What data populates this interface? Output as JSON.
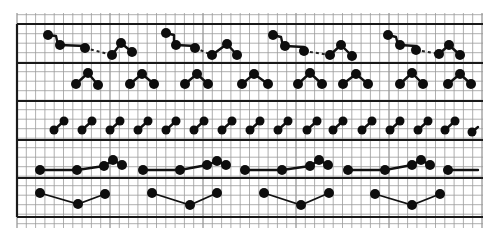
{
  "figure": {
    "width": 497,
    "height": 242,
    "colors": {
      "background": "#ffffff",
      "grid": "#9a9a9a",
      "ink": "#111111"
    }
  },
  "grid": {
    "x_start": 17,
    "x_end": 483,
    "y_start": 13,
    "y_end": 228,
    "spacing": 9.3,
    "left_border_x": 17
  },
  "bands": {
    "dividers_y": [
      24,
      63,
      101,
      140,
      178,
      217
    ],
    "rows": [
      {
        "id": "row-1",
        "pattern": "step-chain-with-dashed-link-and-peak",
        "node_radius": 5,
        "motifs": [
          {
            "nodes": [
              [
                48,
                35
              ],
              [
                60,
                45
              ],
              [
                85,
                48
              ],
              [
                112,
                55
              ],
              [
                121,
                43
              ],
              [
                132,
                52
              ]
            ],
            "corner": [
              56,
              36
            ]
          },
          {
            "nodes": [
              [
                166,
                33
              ],
              [
                176,
                45
              ],
              [
                195,
                48
              ],
              [
                212,
                55
              ],
              [
                227,
                44
              ],
              [
                237,
                55
              ]
            ],
            "corner": [
              174,
              35
            ]
          },
          {
            "nodes": [
              [
                273,
                35
              ],
              [
                285,
                46
              ],
              [
                304,
                51
              ],
              [
                330,
                55
              ],
              [
                341,
                45
              ],
              [
                352,
                56
              ]
            ],
            "corner": [
              281,
              37
            ]
          },
          {
            "nodes": [
              [
                388,
                35
              ],
              [
                400,
                45
              ],
              [
                416,
                50
              ],
              [
                439,
                54
              ],
              [
                449,
                45
              ],
              [
                460,
                55
              ]
            ],
            "corner": [
              396,
              37
            ]
          }
        ]
      },
      {
        "id": "row-2",
        "pattern": "caret-triplet",
        "node_radius": 5,
        "motifs": [
          {
            "nodes": [
              [
                76,
                84
              ],
              [
                88,
                73
              ],
              [
                98,
                85
              ]
            ]
          },
          {
            "nodes": [
              [
                130,
                84
              ],
              [
                142,
                74
              ],
              [
                154,
                84
              ]
            ]
          },
          {
            "nodes": [
              [
                185,
                84
              ],
              [
                197,
                74
              ],
              [
                208,
                84
              ]
            ]
          },
          {
            "nodes": [
              [
                242,
                84
              ],
              [
                254,
                74
              ],
              [
                268,
                84
              ]
            ]
          },
          {
            "nodes": [
              [
                298,
                84
              ],
              [
                310,
                73
              ],
              [
                322,
                84
              ]
            ]
          },
          {
            "nodes": [
              [
                343,
                84
              ],
              [
                356,
                74
              ],
              [
                368,
                84
              ]
            ]
          },
          {
            "nodes": [
              [
                400,
                84
              ],
              [
                412,
                73
              ],
              [
                423,
                84
              ]
            ]
          },
          {
            "nodes": [
              [
                448,
                84
              ],
              [
                460,
                74
              ],
              [
                471,
                84
              ]
            ]
          }
        ]
      },
      {
        "id": "row-3",
        "pattern": "dumbbell-pairs",
        "node_radius": 4.5,
        "motifs": [
          {
            "nodes": [
              [
                54,
                130
              ],
              [
                64,
                121
              ]
            ]
          },
          {
            "nodes": [
              [
                82,
                130
              ],
              [
                92,
                121
              ]
            ]
          },
          {
            "nodes": [
              [
                110,
                130
              ],
              [
                120,
                121
              ]
            ]
          },
          {
            "nodes": [
              [
                138,
                130
              ],
              [
                148,
                121
              ]
            ]
          },
          {
            "nodes": [
              [
                166,
                130
              ],
              [
                176,
                121
              ]
            ]
          },
          {
            "nodes": [
              [
                194,
                130
              ],
              [
                204,
                121
              ]
            ]
          },
          {
            "nodes": [
              [
                222,
                130
              ],
              [
                232,
                121
              ]
            ]
          },
          {
            "nodes": [
              [
                250,
                130
              ],
              [
                260,
                121
              ]
            ]
          },
          {
            "nodes": [
              [
                278,
                130
              ],
              [
                288,
                121
              ]
            ]
          },
          {
            "nodes": [
              [
                307,
                130
              ],
              [
                317,
                121
              ]
            ]
          },
          {
            "nodes": [
              [
                333,
                130
              ],
              [
                343,
                121
              ]
            ]
          },
          {
            "nodes": [
              [
                362,
                130
              ],
              [
                372,
                121
              ]
            ]
          },
          {
            "nodes": [
              [
                390,
                130
              ],
              [
                400,
                121
              ]
            ]
          },
          {
            "nodes": [
              [
                418,
                130
              ],
              [
                428,
                121
              ]
            ]
          },
          {
            "nodes": [
              [
                445,
                130
              ],
              [
                455,
                121
              ]
            ]
          },
          {
            "nodes": [
              [
                472,
                132
              ],
              [
                478,
                127
              ]
            ],
            "partial": true
          }
        ]
      },
      {
        "id": "row-4",
        "pattern": "baseline-with-terminal-peak",
        "node_radius": 5,
        "motifs": [
          {
            "nodes": [
              [
                40,
                170
              ],
              [
                77,
                170
              ],
              [
                104,
                166
              ],
              [
                113,
                160
              ],
              [
                122,
                165
              ]
            ]
          },
          {
            "nodes": [
              [
                143,
                170
              ],
              [
                180,
                170
              ],
              [
                207,
                165
              ],
              [
                217,
                161
              ],
              [
                226,
                165
              ]
            ]
          },
          {
            "nodes": [
              [
                245,
                170
              ],
              [
                282,
                170
              ],
              [
                310,
                166
              ],
              [
                319,
                160
              ],
              [
                328,
                165
              ]
            ]
          },
          {
            "nodes": [
              [
                348,
                170
              ],
              [
                385,
                170
              ],
              [
                412,
                165
              ],
              [
                421,
                160
              ],
              [
                430,
                165
              ]
            ]
          },
          {
            "nodes": [
              [
                448,
                170
              ]
            ],
            "tail_to": [
              478,
              170
            ],
            "partial": true
          }
        ]
      },
      {
        "id": "row-5",
        "pattern": "shallow-v",
        "node_radius": 5,
        "motifs": [
          {
            "nodes": [
              [
                40,
                193
              ],
              [
                78,
                204
              ],
              [
                105,
                194
              ]
            ]
          },
          {
            "nodes": [
              [
                152,
                193
              ],
              [
                190,
                205
              ],
              [
                217,
                193
              ]
            ]
          },
          {
            "nodes": [
              [
                264,
                193
              ],
              [
                301,
                205
              ],
              [
                329,
                193
              ]
            ]
          },
          {
            "nodes": [
              [
                375,
                194
              ],
              [
                412,
                205
              ],
              [
                440,
                194
              ]
            ]
          }
        ]
      }
    ]
  }
}
